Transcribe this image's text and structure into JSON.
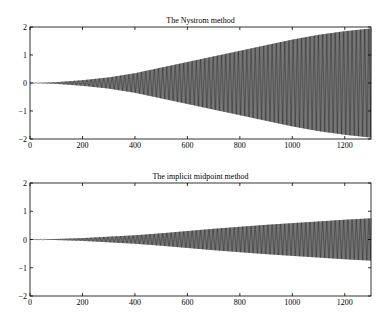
{
  "chart_data": [
    {
      "type": "line",
      "title": "The Nystrom method",
      "xlabel": "",
      "ylabel": "",
      "xlim": [
        0,
        1300
      ],
      "ylim": [
        -2,
        2
      ],
      "xticks": [
        "0",
        "200",
        "400",
        "600",
        "800",
        "1000",
        "1200"
      ],
      "yticks": [
        "2",
        "1",
        "0",
        "-1",
        "-2"
      ],
      "grid": false,
      "legend": null,
      "description": "Rapidly oscillating signal whose amplitude envelope grows with x",
      "envelope": {
        "x": [
          0,
          100,
          200,
          300,
          400,
          500,
          600,
          700,
          800,
          900,
          1000,
          1100,
          1200,
          1300
        ],
        "amplitude": [
          0,
          0.03,
          0.1,
          0.2,
          0.35,
          0.55,
          0.75,
          0.95,
          1.15,
          1.35,
          1.55,
          1.72,
          1.85,
          1.95
        ]
      }
    },
    {
      "type": "line",
      "title": "The implicit midpoint method",
      "xlabel": "",
      "ylabel": "",
      "xlim": [
        0,
        1300
      ],
      "ylim": [
        -2,
        2
      ],
      "xticks": [
        "0",
        "200",
        "400",
        "600",
        "800",
        "1000",
        "1200"
      ],
      "yticks": [
        "2",
        "1",
        "0",
        "-1",
        "-2"
      ],
      "grid": false,
      "legend": null,
      "description": "Rapidly oscillating signal whose amplitude envelope grows slowly with x",
      "envelope": {
        "x": [
          0,
          100,
          200,
          300,
          400,
          500,
          600,
          700,
          800,
          900,
          1000,
          1100,
          1200,
          1300
        ],
        "amplitude": [
          0,
          0.02,
          0.05,
          0.1,
          0.15,
          0.22,
          0.3,
          0.38,
          0.45,
          0.52,
          0.58,
          0.64,
          0.7,
          0.75
        ]
      }
    }
  ],
  "colors": {
    "line": "#000000",
    "axes": "#000000",
    "background": "#ffffff"
  }
}
